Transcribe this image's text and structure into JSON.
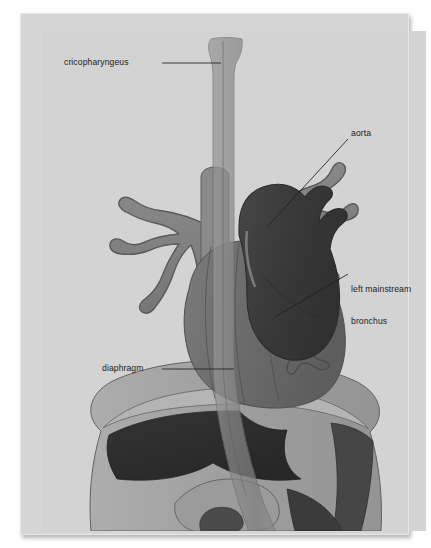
{
  "illustration": {
    "title": "Thoracic anatomy: esophagus, aorta, bronchi and diaphragm",
    "medium": "printed anatomical plate on light gray ground",
    "background_color": "#d6d6d6",
    "paper_color": "#d6d6d6"
  },
  "labels": [
    {
      "id": "cricopharyngeus",
      "text": "cricopharyngeus",
      "leader": "horizontal line to upper esophagus"
    },
    {
      "id": "aorta",
      "text": "aorta",
      "leader": "diagonal line to aortic arch"
    },
    {
      "id": "left_mainstream_bronchus",
      "line1": "left mainstream",
      "line2": "bronchus",
      "leader": "diagonal line to left main bronchus"
    },
    {
      "id": "diaphragm",
      "text": "diaphragm",
      "leader": "horizontal line to diaphragm dome"
    }
  ],
  "structures": [
    {
      "name": "esophagus",
      "color": "#8d8d8d",
      "note": "translucent vertical tube, flared at superior end"
    },
    {
      "name": "trachea",
      "color": "#8a8a8a",
      "note": "descends behind esophagus"
    },
    {
      "name": "bronchial-tree-right",
      "color": "#7e7e7e",
      "note": "branching on viewer left"
    },
    {
      "name": "bronchial-tree-left",
      "color": "#7e7e7e",
      "note": "branching on viewer right"
    },
    {
      "name": "aortic-arch",
      "color": "#3b3b3b",
      "note": "dark arching vessel with descending aorta"
    },
    {
      "name": "heart",
      "color": "#6f6f6f",
      "note": "large central mass with contour lines"
    },
    {
      "name": "diaphragm",
      "color": "#9a9a9a",
      "note": "pale band separating thorax and abdomen"
    },
    {
      "name": "liver",
      "color": "#2f2f2f",
      "note": "dark abdominal organ below diaphragm"
    },
    {
      "name": "stomach",
      "color": "#8f8f8f",
      "note": "pale curved organ at lower center"
    },
    {
      "name": "abdominal-wall",
      "color": "#9d9d9d",
      "note": "outer body contour"
    }
  ],
  "palette": {
    "background": "#d6d6d6",
    "pale_tissue": "#a2a2a2",
    "mid_tissue": "#7e7e7e",
    "heart_tissue": "#6d6d6d",
    "dark_vessel": "#3b3b3b",
    "darkest_organ": "#2f2f2f",
    "outline": "#4a4a4a",
    "label_text": "#1c1c1c"
  }
}
